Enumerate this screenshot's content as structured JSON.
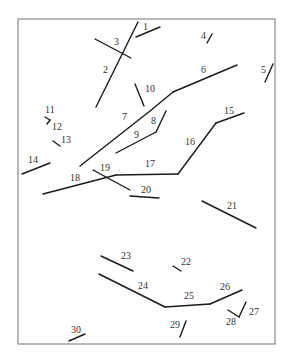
{
  "diagram": {
    "type": "numbered-line-segments",
    "frame": {
      "x": 18,
      "y": 19,
      "width": 257,
      "height": 325,
      "stroke": "#8a8a8a"
    },
    "line_color": "#1a1a1a",
    "label_color": "#333333",
    "segments": [
      {
        "id": "1",
        "label": "1",
        "points": "136,37 160,27",
        "lx": 143,
        "ly": 30
      },
      {
        "id": "2",
        "label": "2",
        "points": "138,22 96,107",
        "lx": 103,
        "ly": 73
      },
      {
        "id": "3",
        "label": "3",
        "points": "95,39 131,58",
        "lx": 114,
        "ly": 45
      },
      {
        "id": "4",
        "label": "4",
        "points": "207,43 212,34",
        "lx": 201,
        "ly": 39
      },
      {
        "id": "5",
        "label": "5",
        "points": "265,82 273,64",
        "lx": 261,
        "ly": 73
      },
      {
        "id": "6",
        "label": "6",
        "points": "173,92 237,65",
        "lx": 201,
        "ly": 73
      },
      {
        "id": "7",
        "label": "7",
        "points": "80,166 150,111 173,92",
        "lx": 122,
        "ly": 120
      },
      {
        "id": "8",
        "label": "8",
        "points": "166,111 156,132",
        "lx": 151,
        "ly": 124
      },
      {
        "id": "9",
        "label": "9",
        "points": "116,153 156,132",
        "lx": 134,
        "ly": 138
      },
      {
        "id": "10",
        "label": "10",
        "points": "135,84 144,106",
        "lx": 145,
        "ly": 92
      },
      {
        "id": "11",
        "label": "11",
        "points": "45,117 50,120",
        "lx": 45,
        "ly": 113
      },
      {
        "id": "12",
        "label": "12",
        "points": "50,120 47,124",
        "lx": 52,
        "ly": 130
      },
      {
        "id": "13",
        "label": "13",
        "points": "53,141 60,146",
        "lx": 61,
        "ly": 143
      },
      {
        "id": "14",
        "label": "14",
        "points": "22,174 50,163",
        "lx": 28,
        "ly": 163
      },
      {
        "id": "15",
        "label": "15",
        "points": "216,123 244,113",
        "lx": 224,
        "ly": 114
      },
      {
        "id": "16",
        "label": "16",
        "points": "178,174 216,123",
        "lx": 185,
        "ly": 145
      },
      {
        "id": "17",
        "label": "17",
        "points": "116,175 178,174",
        "lx": 145,
        "ly": 167
      },
      {
        "id": "18",
        "label": "18",
        "points": "43,194 116,175",
        "lx": 70,
        "ly": 181
      },
      {
        "id": "19",
        "label": "19",
        "points": "93,170 130,190",
        "lx": 100,
        "ly": 171
      },
      {
        "id": "20",
        "label": "20",
        "points": "130,196 159,198",
        "lx": 141,
        "ly": 193
      },
      {
        "id": "21",
        "label": "21",
        "points": "202,201 256,228",
        "lx": 227,
        "ly": 209
      },
      {
        "id": "22",
        "label": "22",
        "points": "173,266 181,271",
        "lx": 181,
        "ly": 265
      },
      {
        "id": "23",
        "label": "23",
        "points": "101,256 133,271",
        "lx": 121,
        "ly": 259
      },
      {
        "id": "24",
        "label": "24",
        "points": "99,274 165,307",
        "lx": 138,
        "ly": 289
      },
      {
        "id": "25",
        "label": "25",
        "points": "165,307 210,304",
        "lx": 184,
        "ly": 299
      },
      {
        "id": "26",
        "label": "26",
        "points": "210,304 242,290",
        "lx": 220,
        "ly": 290
      },
      {
        "id": "27",
        "label": "27",
        "points": "239,317 246,302",
        "lx": 249,
        "ly": 315
      },
      {
        "id": "28",
        "label": "28",
        "points": "228,310 239,317",
        "lx": 226,
        "ly": 325
      },
      {
        "id": "29",
        "label": "29",
        "points": "180,337 186,321",
        "lx": 170,
        "ly": 328
      },
      {
        "id": "30",
        "label": "30",
        "points": "69,341 85,334",
        "lx": 71,
        "ly": 333
      }
    ]
  }
}
